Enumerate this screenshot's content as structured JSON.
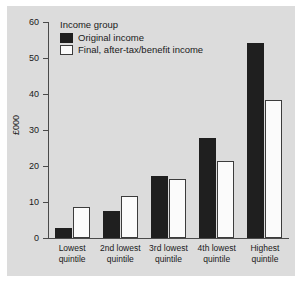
{
  "chart_data": {
    "type": "bar",
    "title": "",
    "xlabel": "",
    "ylabel": "£000",
    "ylim": [
      0,
      60
    ],
    "yticks": [
      0,
      10,
      20,
      30,
      40,
      50,
      60
    ],
    "ytick_labels": [
      "0",
      "10",
      "20",
      "30",
      "40",
      "50",
      "60"
    ],
    "grid": false,
    "legend_position": "top-left",
    "legend_title": "Income group",
    "categories": [
      "Lowest quintile",
      "2nd lowest quintile",
      "3rd lowest quintile",
      "4th lowest quintile",
      "Highest quintile"
    ],
    "category_lines": [
      [
        "Lowest",
        "quintile"
      ],
      [
        "2nd lowest",
        "quintile"
      ],
      [
        "3rd lowest",
        "quintile"
      ],
      [
        "4th lowest",
        "quintile"
      ],
      [
        "Highest",
        "quintile"
      ]
    ],
    "series": [
      {
        "name": "Original income",
        "color": "#1f1f1f",
        "values": [
          2.7,
          7.5,
          17.1,
          27.8,
          54.2
        ]
      },
      {
        "name": "Final, after-tax/benefit income",
        "color": "#fbfbfb",
        "values": [
          8.7,
          11.7,
          16.5,
          21.5,
          38.3
        ]
      }
    ]
  },
  "axis": {
    "y_label": "£000"
  },
  "legend": {
    "title": "Income group",
    "items": [
      {
        "label": "Original income",
        "swatch": "original"
      },
      {
        "label": "Final, after-tax/benefit income",
        "swatch": "final"
      }
    ]
  }
}
